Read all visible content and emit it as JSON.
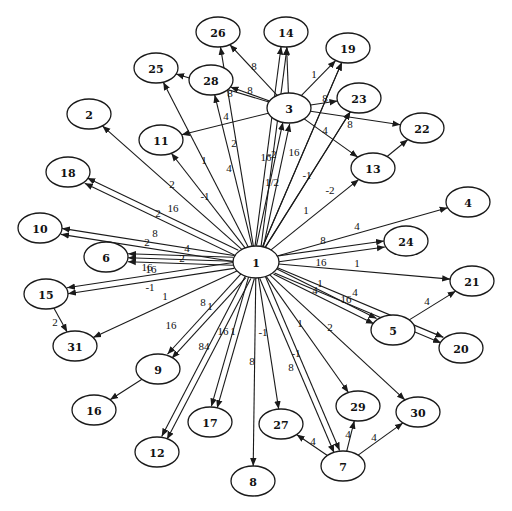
{
  "diagram": {
    "type": "directed-weighted-graph",
    "hub_node": "1",
    "nodes": [
      {
        "id": "1",
        "label": "1",
        "x": 256,
        "y": 262,
        "rx": 23,
        "ry": 16
      },
      {
        "id": "3",
        "label": "3",
        "x": 289,
        "y": 108,
        "rx": 22,
        "ry": 15
      },
      {
        "id": "26",
        "label": "26",
        "x": 218,
        "y": 32,
        "rx": 22,
        "ry": 15
      },
      {
        "id": "14",
        "label": "14",
        "x": 286,
        "y": 32,
        "rx": 22,
        "ry": 15
      },
      {
        "id": "19",
        "label": "19",
        "x": 348,
        "y": 48,
        "rx": 22,
        "ry": 15
      },
      {
        "id": "25",
        "label": "25",
        "x": 156,
        "y": 68,
        "rx": 22,
        "ry": 15
      },
      {
        "id": "28",
        "label": "28",
        "x": 211,
        "y": 80,
        "rx": 22,
        "ry": 15
      },
      {
        "id": "23",
        "label": "23",
        "x": 359,
        "y": 98,
        "rx": 22,
        "ry": 15
      },
      {
        "id": "22",
        "label": "22",
        "x": 422,
        "y": 128,
        "rx": 22,
        "ry": 15
      },
      {
        "id": "13",
        "label": "13",
        "x": 373,
        "y": 168,
        "rx": 22,
        "ry": 15
      },
      {
        "id": "11",
        "label": "11",
        "x": 161,
        "y": 140,
        "rx": 22,
        "ry": 15
      },
      {
        "id": "2",
        "label": "2",
        "x": 89,
        "y": 114,
        "rx": 22,
        "ry": 15
      },
      {
        "id": "18",
        "label": "18",
        "x": 68,
        "y": 172,
        "rx": 22,
        "ry": 15
      },
      {
        "id": "10",
        "label": "10",
        "x": 40,
        "y": 228,
        "rx": 22,
        "ry": 15
      },
      {
        "id": "6",
        "label": "6",
        "x": 106,
        "y": 257,
        "rx": 22,
        "ry": 15
      },
      {
        "id": "4",
        "label": "4",
        "x": 468,
        "y": 202,
        "rx": 22,
        "ry": 15
      },
      {
        "id": "24",
        "label": "24",
        "x": 406,
        "y": 241,
        "rx": 22,
        "ry": 15
      },
      {
        "id": "21",
        "label": "21",
        "x": 472,
        "y": 281,
        "rx": 22,
        "ry": 15
      },
      {
        "id": "5",
        "label": "5",
        "x": 393,
        "y": 330,
        "rx": 22,
        "ry": 15
      },
      {
        "id": "20",
        "label": "20",
        "x": 461,
        "y": 348,
        "rx": 22,
        "ry": 15
      },
      {
        "id": "15",
        "label": "15",
        "x": 46,
        "y": 294,
        "rx": 22,
        "ry": 15
      },
      {
        "id": "31",
        "label": "31",
        "x": 75,
        "y": 346,
        "rx": 22,
        "ry": 15
      },
      {
        "id": "9",
        "label": "9",
        "x": 158,
        "y": 369,
        "rx": 22,
        "ry": 15
      },
      {
        "id": "16",
        "label": "16",
        "x": 94,
        "y": 410,
        "rx": 22,
        "ry": 15
      },
      {
        "id": "17",
        "label": "17",
        "x": 210,
        "y": 422,
        "rx": 22,
        "ry": 15
      },
      {
        "id": "12",
        "label": "12",
        "x": 157,
        "y": 452,
        "rx": 22,
        "ry": 15
      },
      {
        "id": "27",
        "label": "27",
        "x": 281,
        "y": 424,
        "rx": 22,
        "ry": 15
      },
      {
        "id": "8",
        "label": "8",
        "x": 253,
        "y": 481,
        "rx": 22,
        "ry": 15
      },
      {
        "id": "7",
        "label": "7",
        "x": 343,
        "y": 466,
        "rx": 22,
        "ry": 15
      },
      {
        "id": "29",
        "label": "29",
        "x": 358,
        "y": 406,
        "rx": 22,
        "ry": 15
      },
      {
        "id": "30",
        "label": "30",
        "x": 418,
        "y": 412,
        "rx": 22,
        "ry": 15
      }
    ],
    "edges": [
      {
        "from": "1",
        "to": "14",
        "label": "-2",
        "lx": 272,
        "ly": 154,
        "ox": -3
      },
      {
        "from": "1",
        "to": "14",
        "label": "1/2",
        "lx": 272,
        "ly": 182,
        "ox": 3
      },
      {
        "from": "1",
        "to": "3",
        "label": "16",
        "lx": 266,
        "ly": 157,
        "ox": -3
      },
      {
        "from": "1",
        "to": "3",
        "label": "16",
        "lx": 294,
        "ly": 152,
        "ox": 4
      },
      {
        "from": "1",
        "to": "19",
        "label": "-1",
        "lx": 307,
        "ly": 175,
        "ox": 0
      },
      {
        "from": "1",
        "to": "13",
        "label": "-2",
        "lx": 330,
        "ly": 190,
        "ox": 0
      },
      {
        "from": "1",
        "to": "23",
        "label": "1",
        "lx": 306,
        "ly": 210,
        "ox": 0
      },
      {
        "from": "1",
        "to": "26",
        "label": "2",
        "lx": 234,
        "ly": 143,
        "ox": 0
      },
      {
        "from": "1",
        "to": "28",
        "label": "4",
        "lx": 229,
        "ly": 168,
        "ox": 0
      },
      {
        "from": "1",
        "to": "25",
        "label": "1",
        "lx": 204,
        "ly": 160,
        "ox": 0
      },
      {
        "from": "1",
        "to": "11",
        "label": "-1",
        "lx": 205,
        "ly": 196,
        "ox": 0
      },
      {
        "from": "1",
        "to": "2",
        "label": "2",
        "lx": 172,
        "ly": 184,
        "ox": 0
      },
      {
        "from": "1",
        "to": "18",
        "label": "16",
        "lx": 173,
        "ly": 208,
        "ox": -3
      },
      {
        "from": "1",
        "to": "18",
        "label": "2",
        "lx": 158,
        "ly": 213,
        "ox": 3
      },
      {
        "from": "1",
        "to": "10",
        "label": "8",
        "lx": 155,
        "ly": 233,
        "ox": -3
      },
      {
        "from": "1",
        "to": "10",
        "label": "2",
        "lx": 147,
        "ly": 242,
        "ox": 3
      },
      {
        "from": "1",
        "to": "6",
        "label": "4",
        "lx": 187,
        "ly": 248,
        "ox": -4
      },
      {
        "from": "1",
        "to": "6",
        "label": "2",
        "lx": 182,
        "ly": 258,
        "ox": 0
      },
      {
        "from": "1",
        "to": "6",
        "label": "16",
        "lx": 147,
        "ly": 267,
        "ox": 4
      },
      {
        "from": "1",
        "to": "15",
        "label": "16",
        "lx": 151,
        "ly": 269,
        "ox": -3
      },
      {
        "from": "1",
        "to": "15",
        "label": "-1",
        "lx": 150,
        "ly": 287,
        "ox": 3
      },
      {
        "from": "1",
        "to": "31",
        "label": "1",
        "lx": 165,
        "ly": 296,
        "ox": 0
      },
      {
        "from": "1",
        "to": "9",
        "label": "8",
        "lx": 203,
        "ly": 302,
        "ox": -3
      },
      {
        "from": "1",
        "to": "9",
        "label": "1",
        "lx": 210,
        "ly": 306,
        "ox": 3
      },
      {
        "from": "1",
        "to": "12",
        "label": "16",
        "lx": 171,
        "ly": 325,
        "ox": -3
      },
      {
        "from": "1",
        "to": "12",
        "label": "84",
        "lx": 204,
        "ly": 346,
        "ox": 3
      },
      {
        "from": "1",
        "to": "17",
        "label": "16",
        "lx": 223,
        "ly": 331,
        "ox": -3
      },
      {
        "from": "1",
        "to": "17",
        "label": "1",
        "lx": 233,
        "ly": 331,
        "ox": 3
      },
      {
        "from": "1",
        "to": "8",
        "label": "8",
        "lx": 252,
        "ly": 361,
        "ox": 0
      },
      {
        "from": "1",
        "to": "27",
        "label": "-1",
        "lx": 263,
        "ly": 332,
        "ox": 0
      },
      {
        "from": "1",
        "to": "7",
        "label": "8",
        "lx": 291,
        "ly": 367,
        "ox": -3
      },
      {
        "from": "1",
        "to": "7",
        "label": "-1",
        "lx": 296,
        "ly": 353,
        "ox": 3
      },
      {
        "from": "1",
        "to": "29",
        "label": "1",
        "lx": 300,
        "ly": 323,
        "ox": 0
      },
      {
        "from": "1",
        "to": "30",
        "label": "2",
        "lx": 330,
        "ly": 327,
        "ox": 0
      },
      {
        "from": "1",
        "to": "5",
        "label": "1",
        "lx": 320,
        "ly": 283,
        "ox": -3
      },
      {
        "from": "1",
        "to": "5",
        "label": "4",
        "lx": 315,
        "ly": 290,
        "ox": 3
      },
      {
        "from": "1",
        "to": "20",
        "label": "16",
        "lx": 346,
        "ly": 299,
        "ox": -3
      },
      {
        "from": "1",
        "to": "20",
        "label": "4",
        "lx": 355,
        "ly": 292,
        "ox": 3
      },
      {
        "from": "1",
        "to": "21",
        "label": "1",
        "lx": 357,
        "ly": 263,
        "ox": 0
      },
      {
        "from": "1",
        "to": "24",
        "label": "8",
        "lx": 323,
        "ly": 240,
        "ox": -3
      },
      {
        "from": "1",
        "to": "24",
        "label": "16",
        "lx": 321,
        "ly": 262,
        "ox": 3
      },
      {
        "from": "1",
        "to": "4",
        "label": "4",
        "lx": 357,
        "ly": 226,
        "ox": 0
      },
      {
        "from": "3",
        "to": "14",
        "label": "",
        "lx": 0,
        "ly": 0,
        "ox": 0
      },
      {
        "from": "3",
        "to": "26",
        "label": "8",
        "lx": 254,
        "ly": 66,
        "ox": 0
      },
      {
        "from": "3",
        "to": "28",
        "label": "8",
        "lx": 250,
        "ly": 90,
        "ox": 0
      },
      {
        "from": "3",
        "to": "25",
        "label": "8",
        "lx": 230,
        "ly": 93,
        "ox": 0
      },
      {
        "from": "3",
        "to": "19",
        "label": "1",
        "lx": 314,
        "ly": 74,
        "ox": 0
      },
      {
        "from": "1",
        "to": "19",
        "label": "8",
        "lx": 325,
        "ly": 98,
        "ox": 0
      },
      {
        "from": "3",
        "to": "23",
        "label": "",
        "lx": 0,
        "ly": 0,
        "ox": 0
      },
      {
        "from": "1",
        "to": "23",
        "label": "8",
        "lx": 350,
        "ly": 124,
        "ox": 0
      },
      {
        "from": "3",
        "to": "22",
        "label": "",
        "lx": 0,
        "ly": 0,
        "ox": 0
      },
      {
        "from": "3",
        "to": "13",
        "label": "4",
        "lx": 325,
        "ly": 130,
        "ox": 0
      },
      {
        "from": "3",
        "to": "11",
        "label": "4",
        "lx": 226,
        "ly": 116,
        "ox": 0
      },
      {
        "from": "13",
        "to": "22",
        "label": "",
        "lx": 0,
        "ly": 0,
        "ox": 0
      },
      {
        "from": "5",
        "to": "21",
        "label": "4",
        "lx": 427,
        "ly": 301,
        "ox": 0
      },
      {
        "from": "15",
        "to": "31",
        "label": "2",
        "lx": 55,
        "ly": 322,
        "ox": 0
      },
      {
        "from": "9",
        "to": "16",
        "label": "",
        "lx": 0,
        "ly": 0,
        "ox": 0
      },
      {
        "from": "7",
        "to": "27",
        "label": "4",
        "lx": 313,
        "ly": 441,
        "ox": 0
      },
      {
        "from": "7",
        "to": "29",
        "label": "4",
        "lx": 348,
        "ly": 434,
        "ox": 0
      },
      {
        "from": "7",
        "to": "30",
        "label": "4",
        "lx": 374,
        "ly": 437,
        "ox": 0
      }
    ]
  },
  "colors": {
    "background": "#ffffff",
    "stroke": "#1a1a1a",
    "text": "#111111"
  }
}
